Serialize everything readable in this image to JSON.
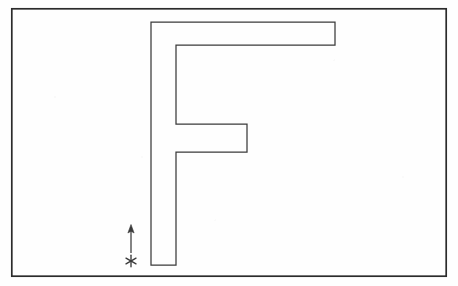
{
  "figure": {
    "title": "F-shaped polygon with start marker and direction arrow",
    "background_color": "#fefefe",
    "stroke_color": "#3a3a3a",
    "stroke_width": 1.2,
    "frame": {
      "name": "outer-frame",
      "x": 11,
      "y": 8,
      "width": 436,
      "height": 269,
      "stroke_color": "#2b2b2b",
      "stroke_width": 1.6
    },
    "f_shape": {
      "name": "f-polygon",
      "fill": "none",
      "stroke_color": "#3a3a3a",
      "points": "151,22 335,22 335,45 176,45 176,124 247,124 247,152 176,152 176,265 151,265",
      "vertices": [
        {
          "label": "top-left-outer",
          "x": 151,
          "y": 22
        },
        {
          "label": "top-arm-right-top",
          "x": 335,
          "y": 22
        },
        {
          "label": "top-arm-right-bottom",
          "x": 335,
          "y": 45
        },
        {
          "label": "top-arm-inner-left",
          "x": 176,
          "y": 45
        },
        {
          "label": "mid-arm-top-left",
          "x": 176,
          "y": 124
        },
        {
          "label": "mid-arm-top-right",
          "x": 247,
          "y": 124
        },
        {
          "label": "mid-arm-bottom-right",
          "x": 247,
          "y": 152
        },
        {
          "label": "mid-arm-bottom-left",
          "x": 176,
          "y": 152
        },
        {
          "label": "stem-bottom-right",
          "x": 176,
          "y": 265
        },
        {
          "label": "stem-bottom-left",
          "x": 151,
          "y": 265
        }
      ],
      "stem_left_x": 151,
      "stem_right_x": 176,
      "stem_bottom_y": 265,
      "top_arm_right_x": 335
    },
    "arrow": {
      "name": "direction-arrow",
      "direction": "up",
      "tail_x": 131,
      "tail_y": 253,
      "head_x": 131,
      "head_y": 225,
      "head_width": 5,
      "head_length": 8,
      "stroke_color": "#3a3a3a",
      "stroke_width": 1.2
    },
    "start_marker": {
      "name": "start-asterisk",
      "glyph": "asterisk",
      "center_x": 131,
      "center_y": 261,
      "radius": 6,
      "rays": 6,
      "stroke_color": "#3a3a3a",
      "stroke_width": 1.3
    }
  }
}
